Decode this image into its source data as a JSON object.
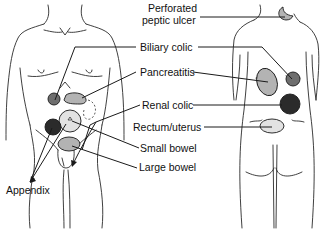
{
  "figure": {
    "type": "medical-diagram",
    "views": [
      "front",
      "back"
    ]
  },
  "labels": {
    "perforated_peptic_ulcer_line1": "Perforated",
    "perforated_peptic_ulcer_line2": "peptic ulcer",
    "biliary_colic": "Biliary colic",
    "pancreatitis": "Pancreatitis",
    "renal_colic": "Renal colic",
    "rectum_uterus": "Rectum/uterus",
    "small_bowel": "Small bowel",
    "large_bowel": "Large bowel",
    "appendix": "Appendix"
  },
  "colors": {
    "dark_fill": "#2b2b2b",
    "mid_fill": "#6e6e6e",
    "light_fill": "#b3b3b3",
    "very_light_fill": "#e2e2e2",
    "outline": "#2a2a2a",
    "background": "#ffffff"
  }
}
